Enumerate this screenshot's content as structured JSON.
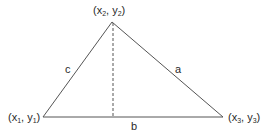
{
  "diagram": {
    "type": "triangle-with-altitude",
    "colors": {
      "stroke": "#555555",
      "text": "#2a2a2a",
      "background": "#ffffff"
    },
    "vertices": [
      {
        "id": "v1",
        "name": "x",
        "sub": "1",
        "name2": "y",
        "sub2": "1",
        "x": 43,
        "y": 117
      },
      {
        "id": "v2",
        "name": "x",
        "sub": "2",
        "name2": "y",
        "sub2": "2",
        "x": 112,
        "y": 22
      },
      {
        "id": "v3",
        "name": "x",
        "sub": "3",
        "name2": "y",
        "sub2": "3",
        "x": 223,
        "y": 117
      }
    ],
    "sides": {
      "a": "a",
      "b": "b",
      "c": "c"
    },
    "altitude": {
      "style": "dashed",
      "from": [
        113,
        22
      ],
      "to": [
        113,
        117
      ]
    }
  }
}
